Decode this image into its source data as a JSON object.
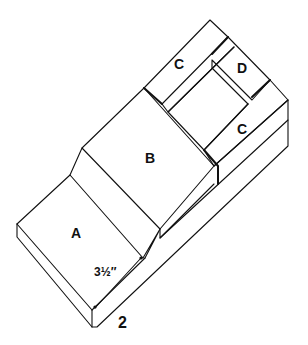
{
  "diagram": {
    "figure_number": "2",
    "parts": [
      {
        "id": "A",
        "label": "A"
      },
      {
        "id": "B",
        "label": "B"
      },
      {
        "id": "C1",
        "label": "C"
      },
      {
        "id": "D",
        "label": "D"
      },
      {
        "id": "C2",
        "label": "C"
      }
    ],
    "dimension": "3½″",
    "colors": {
      "stroke": "#111111",
      "background": "#ffffff"
    }
  }
}
